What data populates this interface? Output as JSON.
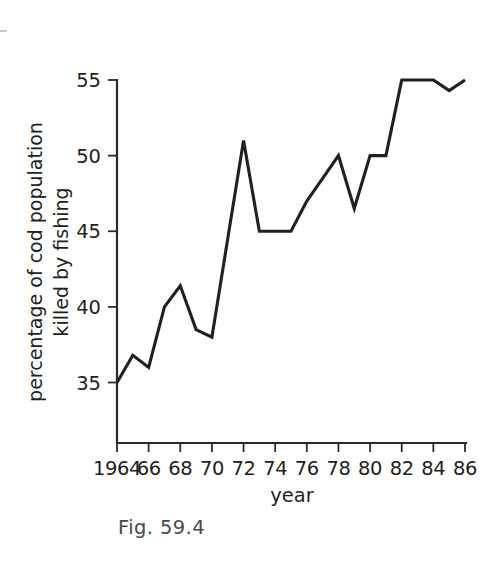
{
  "figure": {
    "caption": "Fig. 59.4"
  },
  "chart_data": {
    "type": "line",
    "title": "",
    "xlabel": "year",
    "ylabel": "percentage of cod population killed by fishing",
    "ylabel_line1": "percentage of cod population",
    "ylabel_line2": "killed by fishing",
    "xlim": [
      1964,
      1986
    ],
    "ylim": [
      31,
      55
    ],
    "grid": false,
    "legend": "none",
    "x_tick_labels": [
      "1964",
      "66",
      "68",
      "70",
      "72",
      "74",
      "76",
      "78",
      "80",
      "82",
      "84",
      "86"
    ],
    "x_ticks": [
      1964,
      1966,
      1968,
      1970,
      1972,
      1974,
      1976,
      1978,
      1980,
      1982,
      1984,
      1986
    ],
    "y_tick_labels": [
      "35",
      "40",
      "45",
      "50",
      "55"
    ],
    "y_ticks": [
      35,
      40,
      45,
      50,
      55
    ],
    "x": [
      1964,
      1965,
      1966,
      1967,
      1968,
      1969,
      1970,
      1971,
      1972,
      1973,
      1974,
      1975,
      1976,
      1977,
      1978,
      1979,
      1980,
      1981,
      1982,
      1983,
      1984,
      1985,
      1986
    ],
    "values": [
      35.0,
      36.8,
      36.0,
      40.0,
      41.4,
      38.5,
      38.0,
      44.5,
      51.0,
      45.0,
      45.0,
      45.0,
      47.0,
      48.5,
      50.0,
      46.5,
      50.0,
      50.0,
      55.0,
      55.0,
      55.0,
      54.3,
      55.0
    ],
    "series": [
      {
        "name": "percentage of cod population killed by fishing",
        "color": "#231f20",
        "values": [
          35.0,
          36.8,
          36.0,
          40.0,
          41.4,
          38.5,
          38.0,
          44.5,
          51.0,
          45.0,
          45.0,
          45.0,
          47.0,
          48.5,
          50.0,
          46.5,
          50.0,
          50.0,
          55.0,
          55.0,
          55.0,
          54.3,
          55.0
        ]
      }
    ]
  }
}
